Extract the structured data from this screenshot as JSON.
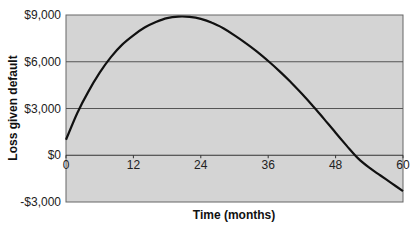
{
  "chart_data": {
    "type": "line",
    "title": "",
    "xlabel": "Time (months)",
    "ylabel": "Loss given default",
    "xlim": [
      0,
      60
    ],
    "ylim": [
      -3000,
      9000
    ],
    "x_ticks": [
      0,
      12,
      24,
      36,
      48,
      60
    ],
    "x_tick_labels": [
      "0",
      "12",
      "24",
      "36",
      "48",
      "60"
    ],
    "y_ticks": [
      -3000,
      0,
      3000,
      6000,
      9000
    ],
    "y_tick_labels": [
      "-$3,000",
      "$0",
      "$3,000",
      "$6,000",
      "$9,000"
    ],
    "grid": "horizontal",
    "legend": null,
    "series": [
      {
        "name": "Loss given default",
        "x": [
          0,
          2,
          4,
          6,
          8,
          10,
          12,
          14,
          16,
          18,
          20,
          22,
          24,
          26,
          28,
          30,
          32,
          34,
          36,
          38,
          40,
          42,
          44,
          46,
          48,
          50,
          52,
          54,
          56,
          58,
          60
        ],
        "values": [
          1000,
          2700,
          4100,
          5300,
          6300,
          7100,
          7700,
          8200,
          8550,
          8800,
          8900,
          8880,
          8750,
          8500,
          8150,
          7700,
          7200,
          6650,
          6050,
          5400,
          4700,
          3950,
          3150,
          2300,
          1450,
          600,
          -200,
          -800,
          -1300,
          -1800,
          -2300
        ]
      }
    ],
    "colors": {
      "plot_bg": "#d4d4d4",
      "line": "#111111",
      "grid": "#555555"
    }
  }
}
